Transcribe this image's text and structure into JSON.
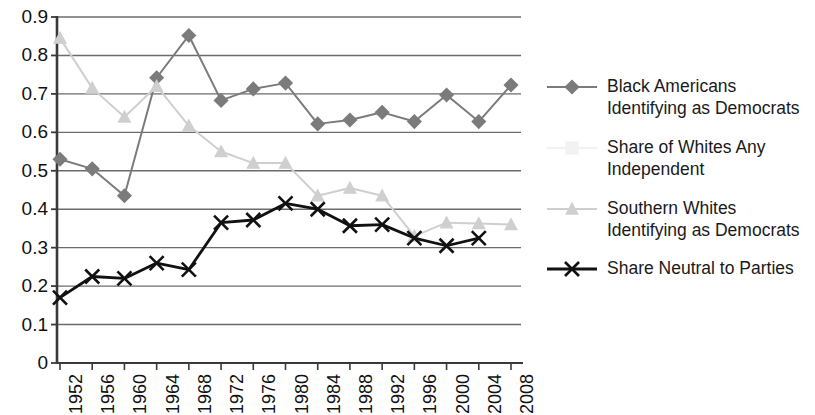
{
  "chart_data": {
    "type": "line",
    "title": "",
    "xlabel": "",
    "ylabel": "",
    "categories": [
      "1952",
      "1956",
      "1960",
      "1964",
      "1968",
      "1972",
      "1976",
      "1980",
      "1984",
      "1988",
      "1992",
      "1996",
      "2000",
      "2004",
      "2008"
    ],
    "yticks": [
      "0",
      "0.1",
      "0.2",
      "0.3",
      "0.4",
      "0.5",
      "0.6",
      "0.7",
      "0.8",
      "0.9"
    ],
    "ylim": [
      0,
      0.9
    ],
    "grid": "horizontal",
    "legend_position": "right",
    "series": [
      {
        "name": "Black Americans Identifying as Democrats",
        "legend_label": "Black Americans\nIdentifying as Democrats",
        "marker": "diamond",
        "color": "#7b7b7b",
        "values": [
          0.53,
          0.505,
          0.435,
          0.742,
          0.852,
          0.683,
          0.713,
          0.728,
          0.622,
          0.632,
          0.652,
          0.628,
          0.697,
          0.628,
          0.723
        ]
      },
      {
        "name": "Share of Whites Any Independent",
        "legend_label": "Share of Whites Any\nIndependent",
        "marker": "square",
        "color": "#f2f2f2",
        "values": [
          null,
          null,
          null,
          null,
          null,
          null,
          null,
          null,
          null,
          null,
          null,
          null,
          null,
          null,
          null
        ]
      },
      {
        "name": "Southern Whites Identifying as Democrats",
        "legend_label": "Southern Whites\nIdentifying as Democrats",
        "marker": "triangle",
        "color": "#cfcfcf",
        "values": [
          0.845,
          0.715,
          0.64,
          0.72,
          0.617,
          0.55,
          0.52,
          0.52,
          0.435,
          0.455,
          0.435,
          0.33,
          0.365,
          0.363,
          0.36
        ]
      },
      {
        "name": "Share Neutral to Parties",
        "legend_label": "Share Neutral to Parties",
        "marker": "cross",
        "color": "#111111",
        "values": [
          0.17,
          0.225,
          0.22,
          0.26,
          0.243,
          0.365,
          0.372,
          0.415,
          0.4,
          0.357,
          0.36,
          0.325,
          0.305,
          0.325,
          null
        ]
      }
    ]
  },
  "axes": {
    "grid_color": "#6b6b6b",
    "axis_color": "#3a3a3a"
  }
}
